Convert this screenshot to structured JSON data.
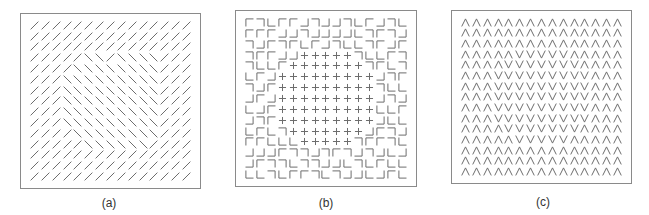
{
  "figure": {
    "panels": [
      {
        "id": "a",
        "caption": "(a)",
        "description": "Texture of oriented line segments; a central region of back-slash segments among forward-slash segments",
        "legend": {
          "/": "forward-slash-line",
          "\\": "back-slash-line"
        },
        "rows": [
          "///////////////",
          "///////////////",
          "///////////////",
          "/////\\\\/\\\\\\\\///",
          "////\\\\\\\\\\\\\\\\///",
          "///\\\\\\\\\\\\\\\\\\///",
          "///\\\\\\\\\\\\\\\\\\///",
          "///\\\\\\\\\\\\\\\\\\///",
          "///\\\\\\\\\\\\\\\\\\///",
          "///\\\\\\\\\\\\\\\\\\///",
          "////\\\\\\\\\\\\\\\\///",
          "/////\\\\\\\\\\\\////",
          "///////////////",
          "///////////////",
          "///////////////"
        ]
      },
      {
        "id": "b",
        "caption": "(b)",
        "description": "Texture of corner elements with a central region of plus signs",
        "legend": {
          "a": "corner-top-left",
          "b": "corner-top-right",
          "c": "corner-bottom-left",
          "d": "corner-bottom-right",
          "+": "plus"
        },
        "rows": [
          "abcaadbddbcadbc",
          "aaaddbddddcbabd",
          "bdabacadbccbada",
          "baadd+++++bccab",
          "bcca+++++++bacb",
          "cad+++++++++dba",
          "bda+++++++++bcc",
          "dad+++++++++dbd",
          "cda+++++++++cca",
          "dba+++++++++dcc",
          "cacb+++++++dabd",
          "aaccc+++++baabc",
          "dddabbdbabdbdcd",
          "dabbcbbddcbcacc",
          "ccbcaabcbddcdac"
        ]
      },
      {
        "id": "c",
        "caption": "(c)",
        "description": "Texture of chevrons; a central region of V shapes among inverted-V shapes",
        "legend": {
          "^": "chevron-up",
          "v": "chevron-down"
        },
        "rows": [
          "^^^^^^^^^^^^^^^",
          "^^^^^^^^^^^^^^^",
          "^^^^^^^^^^^^^^^",
          "^^^^^vvvvv^^^^^",
          "^^^^vvvvvvv^^^^",
          "^^^vvvvvvvvv^^^",
          "^^^vvvvvvvvv^^^",
          "^^^vvvvvvvvv^^^",
          "^^^vvvvvvvvv^^^",
          "^^^vvvvvvvvv^^^",
          "^^^^vvvvvvv^^^^",
          "^^^^^vvvvv^^^^^",
          "^^^^^^^^^^^^^^^",
          "^^^^^^^^^^^^^^^",
          "^^^^^^^^^^^^^^^"
        ]
      }
    ],
    "colors": {
      "stroke": "#6b6b6b",
      "border": "#8a8a8a",
      "background": "#ffffff"
    }
  }
}
